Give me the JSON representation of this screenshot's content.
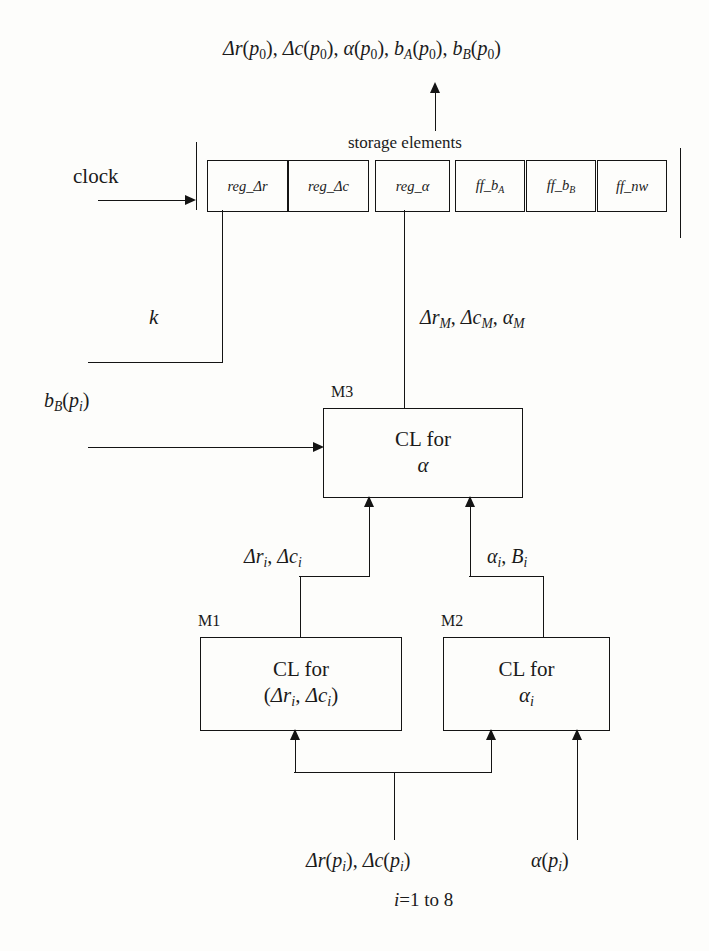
{
  "diagram": {
    "title_formula": "Δr(p0), Δc(p0), α(p0), bA(p0), bB(p0)",
    "storage_caption": "storage elements",
    "clock_label": "clock",
    "k_label": "k",
    "bB_input_label": "bB(pi)",
    "mid_bus_label": "ΔrM, ΔcM, αM",
    "left_bus_label": "Δri, Δci",
    "right_bus_label": "αi, Bi",
    "bottom_left_label": "Δr(pi), Δc(pi)",
    "bottom_right_label": "α(pi)",
    "index_range": "i=1 to 8",
    "storage_cells": [
      {
        "name": "reg_Δr"
      },
      {
        "name": "reg_Δc"
      },
      {
        "name": "reg_α"
      },
      {
        "name": "ff_bA"
      },
      {
        "name": "ff_bB"
      },
      {
        "name": "ff_nw"
      }
    ],
    "modules": [
      {
        "tag": "M3",
        "line1": "CL for",
        "line2": "α"
      },
      {
        "tag": "M1",
        "line1": "CL for",
        "line2": "(Δri, Δci)"
      },
      {
        "tag": "M2",
        "line1": "CL for",
        "line2": "αi"
      }
    ],
    "colors": {
      "ink": "#141414",
      "paper": "#fdfdfb"
    }
  }
}
